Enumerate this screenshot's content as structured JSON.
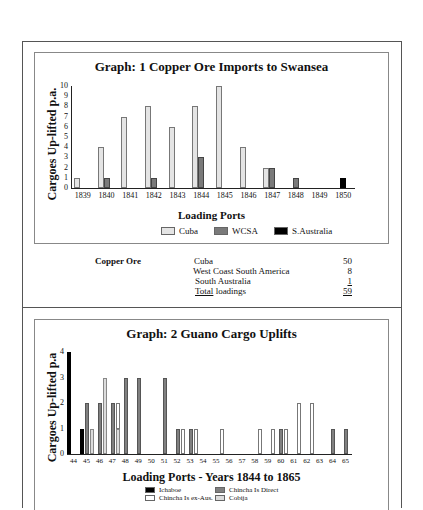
{
  "graph1": {
    "title": "Graph: 1  Copper Ore Imports to Swansea",
    "ylabel": "Cargoes Up-lifted p.a.",
    "xlabel": "Loading Ports",
    "legend": [
      "Cuba",
      "WCSA",
      "S.Australia"
    ]
  },
  "summary": {
    "heading": "Copper Ore",
    "rows": [
      {
        "label": "Cuba",
        "value": "50"
      },
      {
        "label": "West Coast South America",
        "value": "8"
      },
      {
        "label": "South Australia",
        "value": "1"
      },
      {
        "label_underlined": "Total",
        "label": " loadings",
        "value": "59"
      }
    ]
  },
  "graph2": {
    "title": "Graph: 2  Guano Cargo Uplifts",
    "ylabel": "Cargoes Up-lifted p.a",
    "xlabel": "Loading Ports - Years 1844 to 1865",
    "legend": [
      "Ichaboe",
      "Chincha Is Direct",
      "Chincha Is ex-Aus.",
      "Cobija"
    ]
  },
  "chart_data": [
    {
      "type": "bar",
      "title": "Graph: 1  Copper Ore Imports to Swansea",
      "xlabel": "Loading Ports",
      "ylabel": "Cargoes Up-lifted p.a.",
      "ylim": [
        0,
        10
      ],
      "yticks": [
        0,
        1,
        2,
        3,
        4,
        5,
        6,
        7,
        8,
        9,
        10
      ],
      "categories": [
        "1839",
        "1840",
        "1841",
        "1842",
        "1843",
        "1844",
        "1845",
        "1846",
        "1847",
        "1848",
        "1849",
        "1850"
      ],
      "series": [
        {
          "name": "Cuba",
          "values": [
            1,
            4,
            7,
            8,
            6,
            8,
            10,
            4,
            2,
            0,
            0,
            0
          ]
        },
        {
          "name": "WCSA",
          "values": [
            0,
            1,
            0,
            1,
            0,
            3,
            0,
            0,
            2,
            1,
            0,
            0
          ]
        },
        {
          "name": "S.Australia",
          "values": [
            0,
            0,
            0,
            0,
            0,
            0,
            0,
            0,
            0,
            0,
            0,
            1
          ]
        }
      ],
      "legend_position": "bottom",
      "grid": false
    },
    {
      "type": "bar",
      "title": "Graph: 2  Guano Cargo Uplifts",
      "xlabel": "Loading Ports - Years 1844 to 1865",
      "ylabel": "Cargoes Up-lifted p.a",
      "ylim": [
        0,
        4
      ],
      "yticks": [
        0,
        1,
        2,
        3,
        4
      ],
      "categories": [
        "44",
        "45",
        "46",
        "47",
        "48",
        "49",
        "50",
        "51",
        "52",
        "53",
        "54",
        "55",
        "56",
        "57",
        "58",
        "59",
        "60",
        "61",
        "62",
        "63",
        "64",
        "65"
      ],
      "series": [
        {
          "name": "Ichaboe",
          "values": [
            4,
            1,
            0,
            0,
            0,
            0,
            0,
            0,
            0,
            0,
            0,
            0,
            0,
            0,
            0,
            0,
            0,
            0,
            0,
            0,
            0,
            0
          ]
        },
        {
          "name": "Chincha Is Direct",
          "values": [
            0,
            2,
            2,
            2,
            3,
            3,
            0,
            3,
            1,
            1,
            0,
            0,
            0,
            0,
            0,
            0,
            1,
            0,
            0,
            0,
            1,
            1
          ]
        },
        {
          "name": "Chincha Is ex-Aus.",
          "values": [
            0,
            0,
            0,
            1,
            0,
            0,
            0,
            0,
            1,
            1,
            0,
            1,
            0,
            0,
            1,
            1,
            1,
            2,
            2,
            0,
            0,
            0
          ]
        },
        {
          "name": "Cobija",
          "values": [
            0,
            1,
            3,
            1,
            0,
            0,
            0,
            0,
            0,
            0,
            0,
            0,
            0,
            0,
            0,
            0,
            0,
            0,
            0,
            0,
            0,
            0
          ]
        }
      ],
      "legend_position": "bottom",
      "grid": false
    }
  ]
}
